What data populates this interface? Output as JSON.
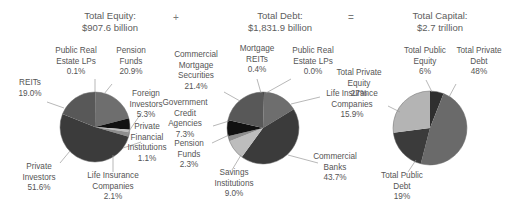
{
  "header": {
    "items": [
      {
        "title": "Total Equity:",
        "value": "$907.6 billion"
      },
      {
        "title": "Total Debt:",
        "value": "$1,831.9 billion"
      },
      {
        "title": "Total Capital:",
        "value": "$2.7 trillion"
      }
    ],
    "operator_plus": "+",
    "operator_equals": "="
  },
  "chart_data": [
    {
      "type": "pie",
      "title": "Total Equity: $907.6 billion",
      "labels": [
        "Public Real Estate LPs",
        "Pension Funds",
        "Foreign Investors",
        "Private Financial Institutions",
        "Life Insurance Companies",
        "Private Investors",
        "REITs"
      ],
      "values": [
        0.1,
        20.9,
        5.3,
        1.1,
        2.1,
        51.6,
        19.0
      ],
      "value_labels": [
        "0.1%",
        "20.9%",
        "5.3%",
        "1.1%",
        "2.1%",
        "51.6%",
        "19.0%"
      ],
      "colors": [
        "#2f2f2f",
        "#6e6e6e",
        "#111111",
        "#bdbdbd",
        "#8e8e8e",
        "#3b3b3b",
        "#585858"
      ],
      "legend": "callout"
    },
    {
      "type": "pie",
      "title": "Total Debt: $1,831.9 billion",
      "labels": [
        "Mortgage REITs",
        "Public Real Estate LPs",
        "Life Insurance Companies",
        "Commercial Banks",
        "Savings Institutions",
        "Pension Funds",
        "Government Credit Agencies",
        "Commercial Mortgage Securities"
      ],
      "values": [
        0.4,
        0.0,
        15.9,
        43.7,
        9.0,
        2.3,
        7.3,
        21.4
      ],
      "value_labels": [
        "0.4%",
        "0.0%",
        "15.9%",
        "43.7%",
        "9.0%",
        "2.3%",
        "7.3%",
        "21.4%"
      ],
      "colors": [
        "#2b2b2b",
        "#2b2b2b",
        "#6e6e6e",
        "#3b3b3b",
        "#bdbdbd",
        "#8e8e8e",
        "#111111",
        "#585858"
      ],
      "legend": "callout"
    },
    {
      "type": "pie",
      "title": "Total Capital: $2.7 trillion",
      "labels": [
        "Total Public Equity",
        "Total Private Debt",
        "Total Public Debt",
        "Total Private Equity"
      ],
      "values": [
        6,
        48,
        19,
        27
      ],
      "value_labels": [
        "6%",
        "48%",
        "19%",
        "27%"
      ],
      "colors": [
        "#2f2f2f",
        "#6a6a6a",
        "#3b3b3b",
        "#b4b4b4"
      ],
      "legend": "callout"
    }
  ],
  "equity_chart": {
    "public_real_estate_lps": {
      "name": "Public Real Estate LPs",
      "pct": "0.1%"
    },
    "pension_funds": {
      "name": "Pension Funds",
      "pct": "20.9%"
    },
    "foreign_investors": {
      "name": "Foreign Investors",
      "pct": "5.3%"
    },
    "private_financial_institutions": {
      "name": "Private Financial Institutions",
      "pct": "1.1%"
    },
    "life_insurance_companies": {
      "name": "Life Insurance Companies",
      "pct": "2.1%"
    },
    "private_investors": {
      "name": "Private Investors",
      "pct": "51.6%"
    },
    "reits": {
      "name": "REITs",
      "pct": "19.0%"
    }
  },
  "debt_chart": {
    "commercial_mortgage_securities": {
      "name": "Commercial Mortgage Securities",
      "pct": "21.4%"
    },
    "mortgage_reits": {
      "name": "Mortgage REITs",
      "pct": "0.4%"
    },
    "public_real_estate_lps": {
      "name": "Public Real Estate LPs",
      "pct": "0.0%"
    },
    "life_insurance_companies": {
      "name": "Life Insurance Companies",
      "pct": "15.9%"
    },
    "commercial_banks": {
      "name": "Commercial Banks",
      "pct": "43.7%"
    },
    "savings_institutions": {
      "name": "Savings Institutions",
      "pct": "9.0%"
    },
    "pension_funds": {
      "name": "Pension Funds",
      "pct": "2.3%"
    },
    "government_credit_agencies": {
      "name": "Government Credit Agencies",
      "pct": "7.3%"
    }
  },
  "capital_chart": {
    "total_public_equity": {
      "name": "Total Public Equity",
      "pct": "6%"
    },
    "total_private_debt": {
      "name": "Total Private Debt",
      "pct": "48%"
    },
    "total_public_debt": {
      "name": "Total Public Debt",
      "pct": "19%"
    },
    "total_private_equity": {
      "name": "Total Private Equity",
      "pct": "27%"
    }
  },
  "label_lines": {
    "public_real_estate_lps_1": "Public Real",
    "public_real_estate_lps_2": "Estate LPs",
    "pension_1": "Pension",
    "pension_2": "Funds",
    "foreign_1": "Foreign",
    "foreign_2": "Investors",
    "pfi_1": "Private",
    "pfi_2": "Financial",
    "pfi_3": "Institutions",
    "lic_1": "Life Insurance",
    "lic_2": "Companies",
    "pi_1": "Private",
    "pi_2": "Investors",
    "reits": "REITs",
    "cms_1": "Commercial",
    "cms_2": "Mortgage",
    "cms_3": "Securities",
    "mreits_1": "Mortgage",
    "mreits_2": "REITs",
    "pre_1": "Public Real",
    "pre_2": "Estate LPs",
    "gca_1": "Government",
    "gca_2": "Credit",
    "gca_3": "Agencies",
    "savings_1": "Savings",
    "savings_2": "Institutions",
    "cbanks_1": "Commercial",
    "cbanks_2": "Banks",
    "tpe_1": "Total Public",
    "tpe_2": "Equity",
    "tprde_1": "Total Private",
    "tprde_2": "Debt",
    "tprv_1": "Total Private",
    "tprv_2": "Equity",
    "tpd_1": "Total Public",
    "tpd_2": "Debt"
  }
}
